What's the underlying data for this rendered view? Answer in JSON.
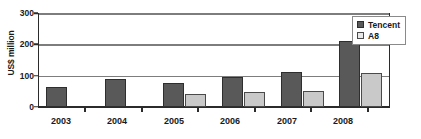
{
  "chart_data": {
    "type": "bar",
    "title": "",
    "xlabel": "",
    "ylabel": "US$ million",
    "ylim": [
      0,
      300
    ],
    "yticks": [
      0,
      100,
      200,
      300
    ],
    "grid": true,
    "legend_position": "top-right",
    "categories": [
      "2003",
      "2004",
      "2005",
      "2006",
      "2007",
      "2008"
    ],
    "series": [
      {
        "name": "Tencent",
        "color": "#595959",
        "values": [
          65,
          88,
          77,
          95,
          112,
          212
        ]
      },
      {
        "name": "A8",
        "color": "#c9c9c9",
        "values": [
          null,
          null,
          40,
          48,
          50,
          110
        ]
      }
    ]
  },
  "axis": {
    "y_title": "US$ million",
    "y_tick_labels": [
      "300",
      "200",
      "100",
      "0"
    ],
    "x_tick_labels": [
      "2003",
      "2004",
      "2005",
      "2006",
      "2007",
      "2008"
    ]
  },
  "legend": {
    "items": [
      {
        "label": "Tencent",
        "swatch": "dark-gray-square-icon"
      },
      {
        "label": "A8",
        "swatch": "light-gray-square-icon"
      }
    ]
  }
}
